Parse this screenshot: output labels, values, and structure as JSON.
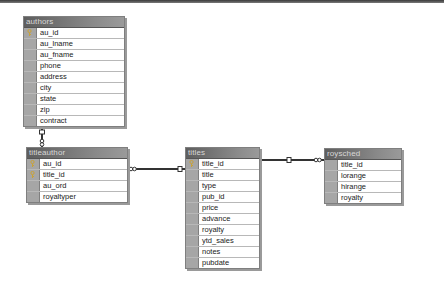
{
  "tables": {
    "authors": {
      "name": "authors",
      "columns": [
        {
          "name": "au_id",
          "key": true
        },
        {
          "name": "au_lname",
          "key": false
        },
        {
          "name": "au_fname",
          "key": false
        },
        {
          "name": "phone",
          "key": false
        },
        {
          "name": "address",
          "key": false
        },
        {
          "name": "city",
          "key": false
        },
        {
          "name": "state",
          "key": false
        },
        {
          "name": "zip",
          "key": false
        },
        {
          "name": "contract",
          "key": false
        }
      ]
    },
    "titleauthor": {
      "name": "titleauthor",
      "columns": [
        {
          "name": "au_id",
          "key": true
        },
        {
          "name": "title_id",
          "key": true
        },
        {
          "name": "au_ord",
          "key": false
        },
        {
          "name": "royaltyper",
          "key": false
        }
      ]
    },
    "titles": {
      "name": "titles",
      "columns": [
        {
          "name": "title_id",
          "key": true
        },
        {
          "name": "title",
          "key": false
        },
        {
          "name": "type",
          "key": false
        },
        {
          "name": "pub_id",
          "key": false
        },
        {
          "name": "price",
          "key": false
        },
        {
          "name": "advance",
          "key": false
        },
        {
          "name": "royalty",
          "key": false
        },
        {
          "name": "ytd_sales",
          "key": false
        },
        {
          "name": "notes",
          "key": false
        },
        {
          "name": "pubdate",
          "key": false
        }
      ]
    },
    "roysched": {
      "name": "roysched",
      "columns": [
        {
          "name": "title_id",
          "key": false
        },
        {
          "name": "lorange",
          "key": false
        },
        {
          "name": "hirange",
          "key": false
        },
        {
          "name": "royalty",
          "key": false
        }
      ]
    }
  },
  "relationships": [
    {
      "from": "authors",
      "to": "titleauthor",
      "one_side": "authors",
      "many_side": "titleauthor"
    },
    {
      "from": "titles",
      "to": "titleauthor",
      "one_side": "titles",
      "many_side": "titleauthor"
    },
    {
      "from": "titles",
      "to": "roysched",
      "one_side": "titles",
      "many_side": "roysched"
    }
  ],
  "colors": {
    "header_bg": "#6e6e6e",
    "header_text": "#d8d8d8",
    "selector": "#a6a6a6",
    "key": "#c8a23a"
  }
}
